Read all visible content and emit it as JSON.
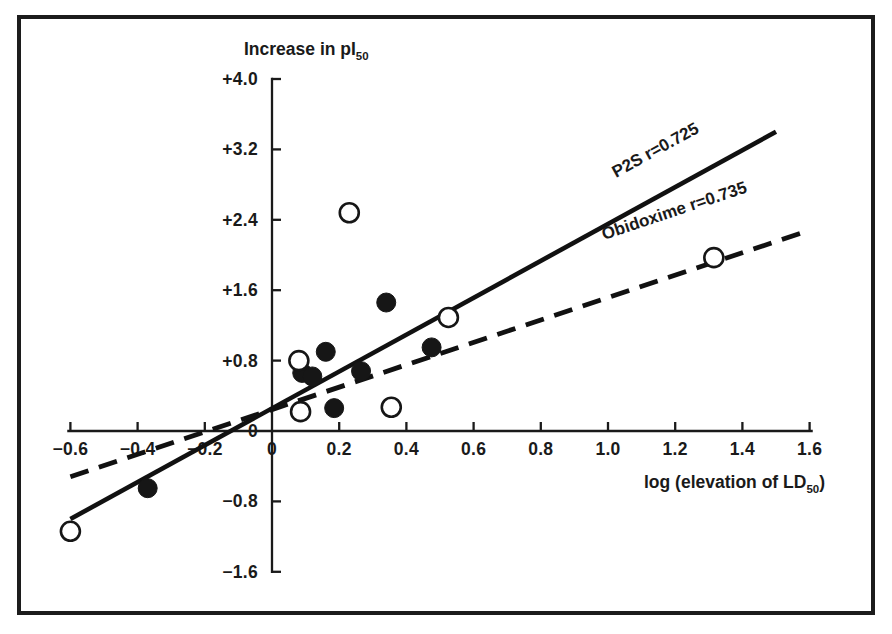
{
  "figure": {
    "frame_color": "#1c1c1c",
    "background": "#ffffff"
  },
  "chart_data": {
    "type": "scatter",
    "title": "",
    "ylabel": "Increase in pI",
    "ylabel_sub": "50",
    "xlabel": "log (elevation of LD",
    "xlabel_sub": "50",
    "xlabel_tail": ")",
    "xlim": [
      -0.7,
      1.65
    ],
    "ylim": [
      -1.75,
      4.15
    ],
    "grid": false,
    "legend_position": "inline-along-lines",
    "xticks": [
      "-0.6",
      "-0.4",
      "-0.2",
      "0",
      "0.2",
      "0.4",
      "0.6",
      "0.8",
      "1.0",
      "1.2",
      "1.4",
      "1.6"
    ],
    "xtick_values": [
      -0.6,
      -0.4,
      -0.2,
      0,
      0.2,
      0.4,
      0.6,
      0.8,
      1.0,
      1.2,
      1.4,
      1.6
    ],
    "yticks": [
      "+4.0",
      "+3.2",
      "+2.4",
      "+1.6",
      "+0.8",
      "0",
      "-0.8",
      "-1.6"
    ],
    "ytick_values": [
      4.0,
      3.2,
      2.4,
      1.6,
      0.8,
      0,
      -0.8,
      -1.6
    ],
    "series": [
      {
        "name": "P2S",
        "marker": "filled-circle",
        "correlation_label": "P2S r=0.725",
        "correlation": 0.725,
        "fit_line": {
          "x1": -0.6,
          "y1": -1.0,
          "x2": 1.5,
          "y2": 3.4
        },
        "points": [
          {
            "x": -0.37,
            "y": -0.65
          },
          {
            "x": 0.09,
            "y": 0.66
          },
          {
            "x": 0.12,
            "y": 0.62
          },
          {
            "x": 0.16,
            "y": 0.9
          },
          {
            "x": 0.185,
            "y": 0.26
          },
          {
            "x": 0.265,
            "y": 0.68
          },
          {
            "x": 0.34,
            "y": 1.46
          },
          {
            "x": 0.475,
            "y": 0.95
          }
        ]
      },
      {
        "name": "Obidoxime",
        "marker": "open-circle",
        "correlation_label": "Obidoxime r=0.735",
        "correlation": 0.735,
        "fit_line": {
          "x1": -0.6,
          "y1": -0.52,
          "x2": 1.6,
          "y2": 2.28
        },
        "points": [
          {
            "x": -0.6,
            "y": -1.14
          },
          {
            "x": 0.08,
            "y": 0.8
          },
          {
            "x": 0.085,
            "y": 0.22
          },
          {
            "x": 0.23,
            "y": 2.48
          },
          {
            "x": 0.355,
            "y": 0.27
          },
          {
            "x": 0.525,
            "y": 1.29
          },
          {
            "x": 1.315,
            "y": 1.97
          }
        ]
      }
    ]
  }
}
